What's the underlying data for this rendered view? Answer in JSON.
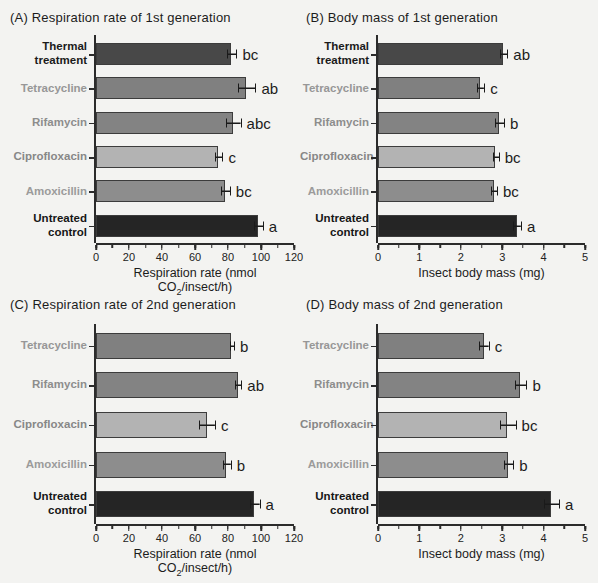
{
  "figure": {
    "background": "#f3f3f1",
    "axis_color": "#2b2b2b",
    "text_color": "#1c1c1c"
  },
  "chart_data": [
    {
      "panel": "A",
      "type": "bar",
      "orientation": "horizontal",
      "title": "(A) Respiration rate of 1st generation",
      "xlabel": {
        "pre": "Respiration rate (nmol CO",
        "sub": "2",
        "post": "/insect/h)"
      },
      "xlim": [
        0,
        120
      ],
      "xticks": [
        0,
        20,
        40,
        60,
        80,
        100,
        120
      ],
      "minor_tick_step": 10,
      "grid": false,
      "rows": [
        {
          "label": "Thermal\ntreatment",
          "label_color": "#1b1b1b",
          "value": 82,
          "error": 2.5,
          "sig": "bc",
          "bar_color": "#484848"
        },
        {
          "label": "Tetracycline",
          "label_color": "#979797",
          "value": 91,
          "error": 5,
          "sig": "ab",
          "bar_color": "#808080"
        },
        {
          "label": "Rifamycin",
          "label_color": "#8d8d8d",
          "value": 83,
          "error": 4,
          "sig": "abc",
          "bar_color": "#838383"
        },
        {
          "label": "Ciprofloxacin",
          "label_color": "#878787",
          "value": 74,
          "error": 2,
          "sig": "c",
          "bar_color": "#b3b3b3"
        },
        {
          "label": "Amoxicillin",
          "label_color": "#9b9b9b",
          "value": 78,
          "error": 2.5,
          "sig": "bc",
          "bar_color": "#8d8d8d"
        },
        {
          "label": "Untreated\ncontrol",
          "label_color": "#161616",
          "value": 98,
          "error": 2.5,
          "sig": "a",
          "bar_color": "#252525"
        }
      ]
    },
    {
      "panel": "B",
      "type": "bar",
      "orientation": "horizontal",
      "title": "(B) Body mass of 1st generation",
      "xlabel": {
        "pre": "Insect body mass (mg)",
        "sub": "",
        "post": ""
      },
      "xlim": [
        0,
        5
      ],
      "xticks": [
        0,
        1,
        2,
        3,
        4,
        5
      ],
      "minor_tick_step": 0.5,
      "grid": false,
      "rows": [
        {
          "label": "Thermal\ntreatment",
          "label_color": "#1b1b1b",
          "value": 3.02,
          "error": 0.08,
          "sig": "ab",
          "bar_color": "#484848"
        },
        {
          "label": "Tetracycline",
          "label_color": "#979797",
          "value": 2.47,
          "error": 0.07,
          "sig": "c",
          "bar_color": "#808080"
        },
        {
          "label": "Rifamycin",
          "label_color": "#8d8d8d",
          "value": 2.92,
          "error": 0.1,
          "sig": "b",
          "bar_color": "#838383"
        },
        {
          "label": "Ciprofloxacin",
          "label_color": "#878787",
          "value": 2.83,
          "error": 0.06,
          "sig": "bc",
          "bar_color": "#b3b3b3"
        },
        {
          "label": "Amoxicillin",
          "label_color": "#9b9b9b",
          "value": 2.79,
          "error": 0.06,
          "sig": "bc",
          "bar_color": "#8d8d8d"
        },
        {
          "label": "Untreated\ncontrol",
          "label_color": "#161616",
          "value": 3.35,
          "error": 0.08,
          "sig": "a",
          "bar_color": "#252525"
        }
      ]
    },
    {
      "panel": "C",
      "type": "bar",
      "orientation": "horizontal",
      "title": "(C) Respiration rate of 2nd generation",
      "xlabel": {
        "pre": "Respiration rate (nmol CO",
        "sub": "2",
        "post": "/insect/h)"
      },
      "xlim": [
        0,
        120
      ],
      "xticks": [
        0,
        20,
        40,
        60,
        80,
        100,
        120
      ],
      "minor_tick_step": 10,
      "grid": false,
      "rows": [
        {
          "label": "Tetracycline",
          "label_color": "#979797",
          "value": 82,
          "error": 1,
          "sig": "b",
          "bar_color": "#808080"
        },
        {
          "label": "Rifamycin",
          "label_color": "#8d8d8d",
          "value": 86,
          "error": 1.5,
          "sig": "ab",
          "bar_color": "#838383"
        },
        {
          "label": "Ciprofloxacin",
          "label_color": "#878787",
          "value": 67,
          "error": 4.5,
          "sig": "c",
          "bar_color": "#b3b3b3"
        },
        {
          "label": "Amoxicillin",
          "label_color": "#9b9b9b",
          "value": 79,
          "error": 2,
          "sig": "b",
          "bar_color": "#8d8d8d"
        },
        {
          "label": "Untreated\ncontrol",
          "label_color": "#161616",
          "value": 96,
          "error": 2.5,
          "sig": "a",
          "bar_color": "#252525"
        }
      ]
    },
    {
      "panel": "D",
      "type": "bar",
      "orientation": "horizontal",
      "title": "(D) Body mass of 2nd generation",
      "xlabel": {
        "pre": "Insect body mass (mg)",
        "sub": "",
        "post": ""
      },
      "xlim": [
        0,
        5
      ],
      "xticks": [
        0,
        1,
        2,
        3,
        4,
        5
      ],
      "minor_tick_step": 0.5,
      "grid": false,
      "rows": [
        {
          "label": "Tetracycline",
          "label_color": "#979797",
          "value": 2.55,
          "error": 0.1,
          "sig": "c",
          "bar_color": "#808080"
        },
        {
          "label": "Rifamycin",
          "label_color": "#8d8d8d",
          "value": 3.44,
          "error": 0.12,
          "sig": "b",
          "bar_color": "#838383"
        },
        {
          "label": "Ciprofloxacin",
          "label_color": "#878787",
          "value": 3.12,
          "error": 0.18,
          "sig": "bc",
          "bar_color": "#b3b3b3"
        },
        {
          "label": "Amoxicillin",
          "label_color": "#9b9b9b",
          "value": 3.14,
          "error": 0.1,
          "sig": "b",
          "bar_color": "#8d8d8d"
        },
        {
          "label": "Untreated\ncontrol",
          "label_color": "#161616",
          "value": 4.18,
          "error": 0.17,
          "sig": "a",
          "bar_color": "#252525"
        }
      ]
    }
  ]
}
